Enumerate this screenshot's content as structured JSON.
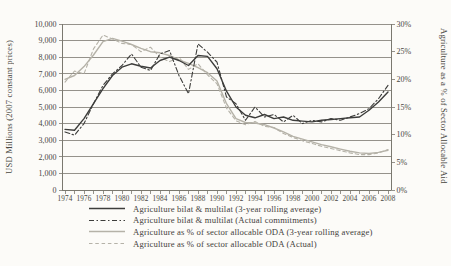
{
  "figure": {
    "background_color": "#fcfbf8",
    "text_color": "#49473f",
    "axis_color": "#7a786f",
    "dark_line_color": "#3d3d3b",
    "light_line_color": "#b5b2a8"
  },
  "chart_data": {
    "type": "line",
    "title": "",
    "x": [
      1974,
      1975,
      1976,
      1977,
      1978,
      1979,
      1980,
      1981,
      1982,
      1983,
      1984,
      1985,
      1986,
      1987,
      1988,
      1989,
      1990,
      1991,
      1992,
      1993,
      1994,
      1995,
      1996,
      1997,
      1998,
      1999,
      2000,
      2001,
      2002,
      2003,
      2004,
      2005,
      2006,
      2007,
      2008
    ],
    "x_tick_labels": [
      "1974",
      "1976",
      "1978",
      "1980",
      "1982",
      "1984",
      "1986",
      "1988",
      "1990",
      "1992",
      "1994",
      "1996",
      "1998",
      "2000",
      "2002",
      "2004",
      "2006",
      "2008"
    ],
    "ylabel_left": "USD Millions (2007 constant prices)",
    "ylabel_right": "Agriculture as a % of Sector Allocable Aid",
    "ylim_left": [
      0,
      10000
    ],
    "ylim_right": [
      0,
      30
    ],
    "y_left_ticks": [
      "0",
      "1,000",
      "2,000",
      "3,000",
      "4,000",
      "5,000",
      "6,000",
      "7,000",
      "8,000",
      "9,000",
      "10,000"
    ],
    "y_right_ticks": [
      "0%",
      "5%",
      "10%",
      "15%",
      "20%",
      "25%",
      "30%"
    ],
    "grid": "horizontal",
    "legend_position": "bottom-left",
    "series": [
      {
        "name": "Agriculture bilat & multilat (3-year rolling average)",
        "axis": "left",
        "style": "solid",
        "color": "#3d3d3b",
        "values": [
          3650,
          3600,
          4300,
          5200,
          6100,
          6900,
          7400,
          7600,
          7450,
          7350,
          7800,
          8000,
          7800,
          7500,
          8100,
          8050,
          7300,
          5950,
          5000,
          4500,
          4350,
          4550,
          4300,
          4400,
          4200,
          4150,
          4100,
          4200,
          4250,
          4300,
          4350,
          4400,
          4800,
          5300,
          5900
        ]
      },
      {
        "name": "Agriculture bilat & multilat (Actual commitments)",
        "axis": "left",
        "style": "dash-dot",
        "color": "#3d3d3b",
        "values": [
          3500,
          3300,
          4000,
          5200,
          6300,
          7000,
          7500,
          8200,
          7400,
          7200,
          8200,
          8400,
          6900,
          5800,
          8800,
          8300,
          7700,
          5600,
          5200,
          4200,
          5000,
          4400,
          4550,
          4100,
          4500,
          4000,
          4200,
          4100,
          4300,
          4200,
          4400,
          4600,
          4900,
          5500,
          6300
        ]
      },
      {
        "name": "Agriculture as % of sector allocable ODA (3-year rolling average)",
        "axis": "right",
        "style": "solid",
        "color": "#b5b2a8",
        "values": [
          20.0,
          20.7,
          22.3,
          24.4,
          26.8,
          27.4,
          26.9,
          26.3,
          25.6,
          25.0,
          24.8,
          24.3,
          23.5,
          22.9,
          22.1,
          21.2,
          19.7,
          15.6,
          12.9,
          12.2,
          12.1,
          11.8,
          11.2,
          10.5,
          9.7,
          9.2,
          8.7,
          8.2,
          7.8,
          7.4,
          7.0,
          6.7,
          6.6,
          6.8,
          7.2
        ]
      },
      {
        "name": "Agriculture as % of sector allocable ODA (Actual)",
        "axis": "right",
        "style": "dashed",
        "color": "#b5b2a8",
        "values": [
          19.5,
          21.5,
          21.0,
          25.5,
          28.0,
          27.3,
          26.5,
          26.3,
          25.0,
          25.8,
          24.0,
          23.2,
          24.0,
          21.8,
          22.8,
          20.8,
          19.2,
          14.8,
          12.5,
          11.8,
          12.4,
          11.5,
          11.3,
          10.2,
          9.5,
          8.9,
          8.4,
          7.9,
          7.5,
          7.1,
          6.7,
          6.4,
          6.4,
          6.7,
          7.3
        ]
      }
    ]
  }
}
